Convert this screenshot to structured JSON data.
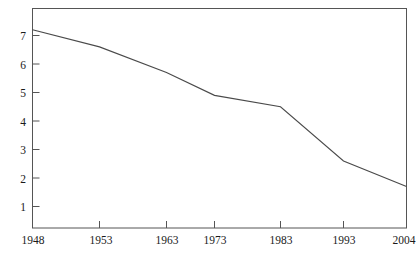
{
  "chart_data": {
    "type": "line",
    "title": "",
    "subtitle": "",
    "xlabel": "",
    "ylabel": "",
    "x": [
      1948,
      1953,
      1963,
      1973,
      1983,
      1993,
      2004
    ],
    "categories": [
      "1948",
      "1953",
      "1963",
      "1973",
      "1983",
      "1993",
      "2004"
    ],
    "values": [
      7.2,
      6.6,
      5.7,
      4.9,
      4.5,
      2.6,
      1.7
    ],
    "series": [
      {
        "name": "",
        "values": [
          7.2,
          6.6,
          5.7,
          4.9,
          4.5,
          2.6,
          1.7
        ]
      }
    ],
    "xlim": [
      1948,
      2004
    ],
    "ylim": [
      0,
      7.75
    ],
    "y_ticks": [
      1,
      2,
      3,
      4,
      5,
      6,
      7
    ],
    "y_tick_labels": [
      "1",
      "2",
      "3",
      "4",
      "5",
      "6",
      "7"
    ],
    "x_ticks": [
      1948,
      1953,
      1963,
      1973,
      1983,
      1993,
      2004
    ],
    "x_tick_labels": [
      "1948",
      "1953",
      "1963",
      "1973",
      "1983",
      "1993",
      "2004"
    ],
    "grid": false,
    "legend": false,
    "legend_position": "none",
    "line_color": "#4a4a4a",
    "frame_color": "#555555",
    "background_color": "#ffffff",
    "annotations": []
  },
  "top_fragment": {
    "text": "....."
  }
}
